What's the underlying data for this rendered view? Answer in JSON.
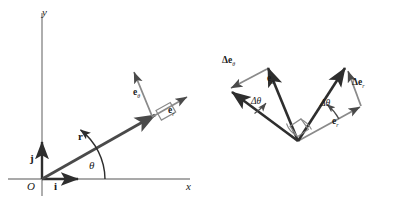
{
  "figure": {
    "type": "vector-diagram",
    "background": "#ffffff",
    "line_color": "#4a4a4a",
    "dark_line_color": "#2e2e2e",
    "text_color": "#1a1a1a",
    "width": 394,
    "height": 203
  },
  "left_diagram": {
    "name": "polar-unit-vectors-at-point",
    "axis_y_label": "y",
    "axis_x_label": "x",
    "origin_label": "O",
    "basis_j_label": "j",
    "basis_i_label": "i",
    "position_vector_label": "r",
    "angle_label": "θ",
    "e_theta_label": "e",
    "e_theta_sub": "θ",
    "e_r_label": "e",
    "e_r_sub": "r",
    "right_angle_marker": "square"
  },
  "right_diagram": {
    "name": "unit-vector-increments",
    "e_theta_label": "e",
    "e_theta_sub": "θ",
    "e_r_label": "e",
    "e_r_sub": "r",
    "delta_e_theta_label": "Δe",
    "delta_e_theta_sub": "θ",
    "delta_e_r_label": "Δe",
    "delta_e_r_sub": "r",
    "delta_theta_left_label": "Δθ",
    "delta_theta_right_label": "Δθ",
    "right_angle_marker": "square",
    "arc_marker": "arc"
  }
}
